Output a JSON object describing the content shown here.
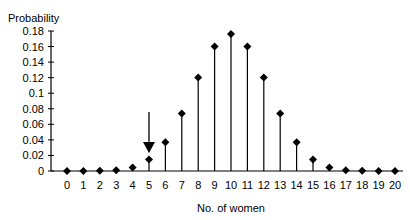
{
  "chart_data": {
    "type": "stem",
    "title": "",
    "ylabel": "Probability",
    "xlabel": "No. of women",
    "ylim": [
      0,
      0.18
    ],
    "yticks": [
      0,
      0.02,
      0.04,
      0.06,
      0.08,
      0.1,
      0.12,
      0.14,
      0.16,
      0.18
    ],
    "ytick_labels": [
      "0",
      "0.02",
      "0.04",
      "0.06",
      "0.08",
      "0.1",
      "0.12",
      "0.14",
      "0.16",
      "0.18"
    ],
    "x": [
      0,
      1,
      2,
      3,
      4,
      5,
      6,
      7,
      8,
      9,
      10,
      11,
      12,
      13,
      14,
      15,
      16,
      17,
      18,
      19,
      20
    ],
    "values": [
      1e-06,
      2e-05,
      0.0002,
      0.0011,
      0.0046,
      0.0148,
      0.037,
      0.0739,
      0.1201,
      0.1602,
      0.1762,
      0.1602,
      0.1201,
      0.0739,
      0.037,
      0.0148,
      0.0046,
      0.0011,
      0.0002,
      2e-05,
      1e-06
    ],
    "grid": false,
    "marker": "diamond",
    "annotations": [
      {
        "type": "arrow",
        "x": 5,
        "direction": "down"
      }
    ]
  }
}
